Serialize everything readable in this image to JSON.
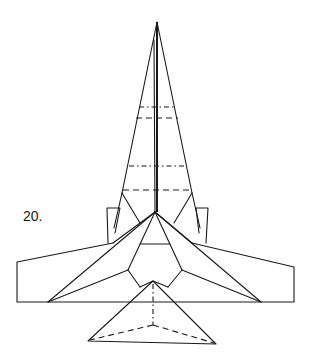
{
  "diagram": {
    "type": "origami-fold-instruction",
    "step_label": "20.",
    "line_color": "#1a1a1a",
    "background": "#ffffff"
  }
}
